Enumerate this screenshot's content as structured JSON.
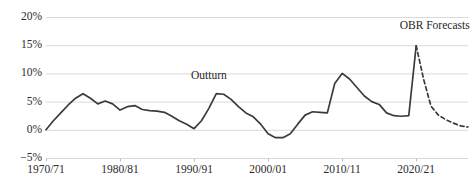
{
  "chart_data": {
    "type": "line",
    "title": "",
    "xlabel": "",
    "ylabel": "",
    "ylim": [
      -5,
      20
    ],
    "yticks": [
      -5,
      0,
      5,
      10,
      15,
      20
    ],
    "ytick_labels": [
      "−5%",
      "0%",
      "5%",
      "10%",
      "15%",
      "20%"
    ],
    "grid": "horizontal",
    "legend": "none",
    "xtick_labels": [
      "1970/71",
      "1980/81",
      "1990/91",
      "2000/01",
      "2010/11",
      "2020/21"
    ],
    "xticks": [
      1970,
      1980,
      1990,
      2000,
      2010,
      2020
    ],
    "xlim": [
      1970,
      2027
    ],
    "annotations": [
      {
        "text": "Outturn",
        "x": 1992,
        "y": 9.5
      },
      {
        "text": "OBR Forecasts",
        "x": 2022.5,
        "y": 18.4
      }
    ],
    "series": [
      {
        "name": "Outturn",
        "style": "solid",
        "color": "#3b3b3b",
        "x": [
          1970,
          1971,
          1972,
          1973,
          1974,
          1975,
          1976,
          1977,
          1978,
          1979,
          1980,
          1981,
          1982,
          1983,
          1984,
          1985,
          1986,
          1987,
          1988,
          1989,
          1990,
          1991,
          1992,
          1993,
          1994,
          1995,
          1996,
          1997,
          1998,
          1999,
          2000,
          2001,
          2002,
          2003,
          2004,
          2005,
          2006,
          2007,
          2008,
          2009,
          2010,
          2011,
          2012,
          2013,
          2014,
          2015,
          2016,
          2017,
          2018,
          2019,
          2020
        ],
        "values": [
          0.0,
          1.6,
          3.0,
          4.4,
          5.6,
          6.4,
          5.6,
          4.6,
          5.1,
          4.6,
          3.5,
          4.1,
          4.3,
          3.6,
          3.4,
          3.3,
          3.1,
          2.4,
          1.6,
          1.0,
          0.2,
          1.6,
          3.8,
          6.4,
          6.3,
          5.4,
          4.1,
          3.0,
          2.3,
          1.0,
          -0.7,
          -1.4,
          -1.4,
          -0.7,
          1.0,
          2.6,
          3.2,
          3.1,
          3.0,
          8.2,
          10.0,
          9.0,
          7.5,
          6.0,
          5.0,
          4.5,
          3.0,
          2.5,
          2.4,
          2.5,
          14.9
        ]
      },
      {
        "name": "OBR Forecasts",
        "style": "dashed",
        "color": "#3b3b3b",
        "x": [
          2020,
          2021,
          2022,
          2023,
          2024,
          2025,
          2026,
          2027
        ],
        "values": [
          14.9,
          9.0,
          4.2,
          2.6,
          1.8,
          1.2,
          0.7,
          0.5
        ]
      }
    ]
  }
}
